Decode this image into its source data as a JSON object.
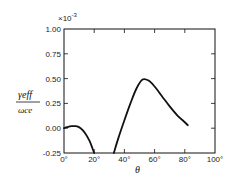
{
  "chart_data": {
    "type": "line",
    "title": "",
    "xlabel": "θ",
    "ylabel": "γeff / ωce",
    "y_multiplier": "×10⁻³",
    "xlim": [
      0,
      100
    ],
    "ylim": [
      -0.25,
      1.0
    ],
    "x_ticks": [
      "0°",
      "20°",
      "40°",
      "60°",
      "80°",
      "100°"
    ],
    "y_ticks": [
      "1.00",
      "0.75",
      "0.50",
      "0.25",
      "0.00",
      "-0.25"
    ],
    "grid": false,
    "legend": null,
    "series": [
      {
        "name": "segment-1",
        "x": [
          0,
          2,
          5,
          8,
          11,
          14,
          17,
          19,
          20
        ],
        "y": [
          0.0,
          0.01,
          0.02,
          0.02,
          0.0,
          -0.05,
          -0.13,
          -0.21,
          -0.25
        ]
      },
      {
        "name": "segment-2",
        "x": [
          33,
          36,
          40,
          44,
          48,
          52,
          56,
          60,
          65,
          70,
          75,
          80,
          82
        ],
        "y": [
          -0.25,
          -0.1,
          0.08,
          0.25,
          0.4,
          0.49,
          0.48,
          0.42,
          0.32,
          0.22,
          0.13,
          0.06,
          0.03
        ]
      }
    ]
  },
  "labels": {
    "multiplier": "×10",
    "exponent": "-3",
    "ylabel_num": "γeff",
    "ylabel_den": "ωce",
    "xlabel": "θ"
  }
}
